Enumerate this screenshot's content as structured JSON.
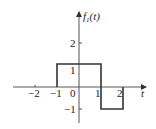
{
  "diagram": {
    "title": "f1(t)",
    "y_label_main": "f",
    "y_label_sub": "1",
    "y_label_arg": "(t)",
    "x_label": "t",
    "x_ticks": [
      "−2",
      "−1",
      "0",
      "1",
      "2"
    ],
    "y_ticks": [
      "2",
      "1",
      "−1"
    ],
    "signal": [
      {
        "from": -1,
        "to": 1,
        "value": 1
      },
      {
        "from": 1,
        "to": 2,
        "value": -1
      }
    ],
    "line_color": "#333333"
  }
}
